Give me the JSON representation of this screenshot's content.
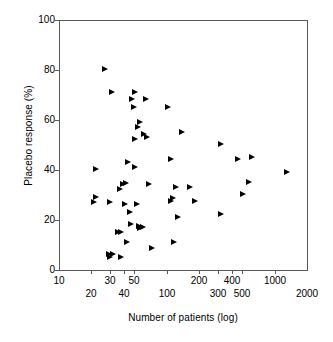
{
  "chart_data": {
    "type": "scatter",
    "title": "",
    "xlabel": "Number of patients (log)",
    "ylabel": "Placebo response (%)",
    "xscale": "log",
    "xlim": [
      10,
      2000
    ],
    "ylim": [
      0,
      100
    ],
    "grid": false,
    "legend": null,
    "marker": "right-pointing-triangle",
    "marker_color": "#000000",
    "xticks_upper": [
      "10",
      "30",
      "50",
      "200",
      "400",
      "1000"
    ],
    "xticks_upper_values": [
      10,
      30,
      50,
      200,
      400,
      1000
    ],
    "xticks_lower": [
      "20",
      "40",
      "100",
      "300",
      "500",
      "2000"
    ],
    "xticks_lower_values": [
      20,
      40,
      100,
      300,
      500,
      2000
    ],
    "yticks": [
      "0",
      "20",
      "40",
      "60",
      "80",
      "100"
    ],
    "ytick_values": [
      0,
      20,
      40,
      60,
      80,
      100
    ],
    "points": [
      {
        "x": 27,
        "y": 80
      },
      {
        "x": 31,
        "y": 71
      },
      {
        "x": 51,
        "y": 71
      },
      {
        "x": 48,
        "y": 68
      },
      {
        "x": 64,
        "y": 68
      },
      {
        "x": 50,
        "y": 65
      },
      {
        "x": 103,
        "y": 65
      },
      {
        "x": 57,
        "y": 59
      },
      {
        "x": 54,
        "y": 57
      },
      {
        "x": 140,
        "y": 55
      },
      {
        "x": 62,
        "y": 54
      },
      {
        "x": 66,
        "y": 53
      },
      {
        "x": 51,
        "y": 52
      },
      {
        "x": 320,
        "y": 50
      },
      {
        "x": 460,
        "y": 44
      },
      {
        "x": 109,
        "y": 44
      },
      {
        "x": 620,
        "y": 45
      },
      {
        "x": 44,
        "y": 43
      },
      {
        "x": 51,
        "y": 41
      },
      {
        "x": 22,
        "y": 40
      },
      {
        "x": 1300,
        "y": 39
      },
      {
        "x": 580,
        "y": 35
      },
      {
        "x": 42,
        "y": 34.5
      },
      {
        "x": 39,
        "y": 34
      },
      {
        "x": 68,
        "y": 34
      },
      {
        "x": 122,
        "y": 33
      },
      {
        "x": 163,
        "y": 33
      },
      {
        "x": 37,
        "y": 32
      },
      {
        "x": 510,
        "y": 30
      },
      {
        "x": 22,
        "y": 29
      },
      {
        "x": 114,
        "y": 28.5
      },
      {
        "x": 21,
        "y": 27
      },
      {
        "x": 30,
        "y": 27
      },
      {
        "x": 110,
        "y": 27.5
      },
      {
        "x": 185,
        "y": 27.5
      },
      {
        "x": 41,
        "y": 26
      },
      {
        "x": 53,
        "y": 26
      },
      {
        "x": 46,
        "y": 23
      },
      {
        "x": 128,
        "y": 21
      },
      {
        "x": 320,
        "y": 22
      },
      {
        "x": 47,
        "y": 18
      },
      {
        "x": 55,
        "y": 17.5
      },
      {
        "x": 60,
        "y": 17
      },
      {
        "x": 57,
        "y": 16.5
      },
      {
        "x": 35,
        "y": 15
      },
      {
        "x": 38,
        "y": 15
      },
      {
        "x": 43,
        "y": 11
      },
      {
        "x": 117,
        "y": 11
      },
      {
        "x": 73,
        "y": 8.5
      },
      {
        "x": 29,
        "y": 6
      },
      {
        "x": 32,
        "y": 6
      },
      {
        "x": 30,
        "y": 5
      },
      {
        "x": 38,
        "y": 5
      }
    ]
  }
}
